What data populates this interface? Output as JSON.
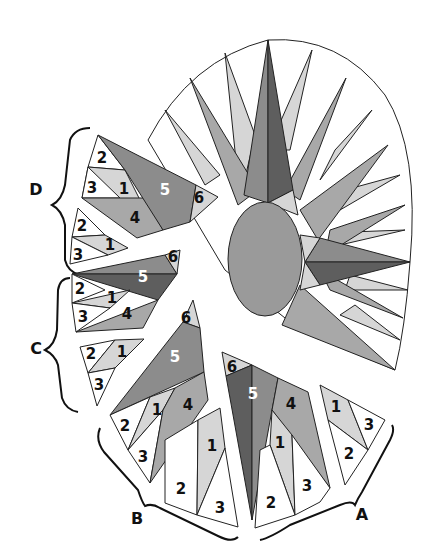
{
  "colors": {
    "white": "#ffffff",
    "light": "#d6d6d6",
    "medium": "#a8a8a8",
    "mediumdark": "#8c8c8c",
    "dark": "#5e5e5e",
    "center": "#9a9a9a",
    "outline": "#222222"
  },
  "groups": {
    "A": "A",
    "B": "B",
    "C": "C",
    "D": "D"
  },
  "pieces": {
    "d_top": {
      "p2": "2",
      "p3": "3",
      "p1": "1",
      "p4": "4",
      "p5": "5",
      "p6": "6"
    },
    "d_bottom": {
      "p2": "2",
      "p1": "1",
      "p3": "3"
    },
    "c_top": {
      "p5": "5",
      "p6": "6",
      "p2": "2",
      "p1": "1",
      "p3": "3",
      "p4": "4"
    },
    "c_bottom": {
      "p2": "2",
      "p1": "1",
      "p3": "3"
    },
    "b_top": {
      "p6": "6",
      "p5": "5",
      "p2": "2",
      "p1": "1",
      "p4": "4",
      "p3": "3"
    },
    "b_bottom": {
      "p1": "1",
      "p2": "2",
      "p3": "3"
    },
    "a_top": {
      "p6": "6",
      "p5": "5",
      "p4": "4",
      "p1": "1",
      "p2": "2",
      "p3": "3"
    },
    "a_bottom": {
      "p1": "1",
      "p3": "3",
      "p2": "2"
    }
  }
}
